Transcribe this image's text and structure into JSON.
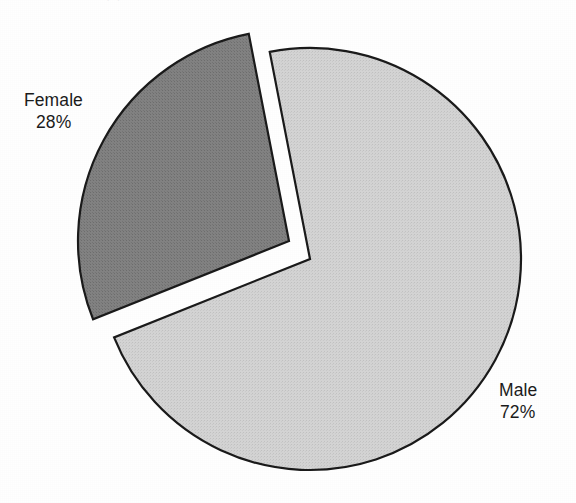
{
  "figure": {
    "background_color": "#ffffff",
    "top_scan_artifact_text": "· ·"
  },
  "chart_data": {
    "type": "pie",
    "title": "",
    "subtitle": "",
    "xlabel": "",
    "ylabel": "",
    "grid": false,
    "legend_position": "none",
    "labels_inline": true,
    "total_percent": 100,
    "start_angle_deg": 349,
    "direction": "clockwise",
    "center": {
      "x": 310,
      "y": 259
    },
    "radius": 211,
    "categories": [
      "Male",
      "Female"
    ],
    "values": [
      72,
      28
    ],
    "slices": [
      {
        "name": "Male",
        "label": "Male",
        "value": 72,
        "value_text": "72%",
        "color": "#d2d2d2",
        "edge_color": "#1a1a1a",
        "exploded": false,
        "explode_offset": {
          "x": 0,
          "y": 0
        },
        "start_angle_deg": 349,
        "end_angle_deg": 608.2
      },
      {
        "name": "Female",
        "label": "Female",
        "value": 28,
        "value_text": "28%",
        "color": "#7f7f7f",
        "edge_color": "#1a1a1a",
        "exploded": true,
        "explode_offset": {
          "x": -21,
          "y": -18
        },
        "start_angle_deg": 248.2,
        "end_angle_deg": 349
      }
    ],
    "annotations": [
      {
        "name": "female-label",
        "text": "Female",
        "percent_text": "28%",
        "x": 24,
        "y": 89
      },
      {
        "name": "male-label",
        "text": "Male",
        "percent_text": "72%",
        "x": 499,
        "y": 379
      }
    ]
  },
  "labels": {
    "female": {
      "name": "Female",
      "percent": "28%"
    },
    "male": {
      "name": "Male",
      "percent": "72%"
    }
  },
  "colors": {
    "male_fill": "#d2d2d2",
    "female_fill": "#7f7f7f",
    "outline": "#1a1a1a",
    "text": "#1b1b1b",
    "background": "#ffffff"
  }
}
